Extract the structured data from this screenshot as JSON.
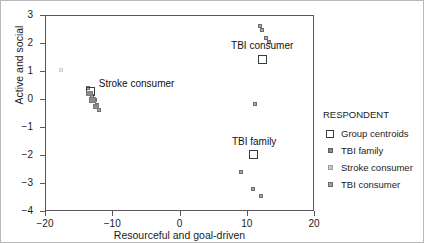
{
  "chart_data": {
    "type": "scatter",
    "title": "",
    "xlabel": "Resourceful and goal-driven",
    "ylabel": "Active and social",
    "xlim": [
      -20,
      20
    ],
    "ylim": [
      -4,
      3
    ],
    "xticks": [
      "-20",
      "-10",
      "0",
      "10",
      "20"
    ],
    "xtick_values": [
      -20,
      -10,
      0,
      10,
      20
    ],
    "yticks": [
      "3",
      "2",
      "1",
      "0",
      "-1",
      "-2",
      "-3",
      "-4"
    ],
    "ytick_values": [
      3,
      2,
      1,
      0,
      -1,
      -2,
      -3,
      -4
    ],
    "grid": false,
    "legend_position": "right",
    "series": [
      {
        "name": "TBI consumer",
        "marker": "small-square",
        "points": [
          {
            "x": 11.9,
            "y": 2.62
          },
          {
            "x": 12.3,
            "y": 2.48
          },
          {
            "x": 12.9,
            "y": 2.18
          },
          {
            "x": 13.3,
            "y": 2.05
          },
          {
            "x": 11.2,
            "y": -0.18
          }
        ]
      },
      {
        "name": "TBI family",
        "marker": "small-square",
        "points": [
          {
            "x": 9.1,
            "y": -2.62
          },
          {
            "x": 11.0,
            "y": -3.22
          },
          {
            "x": 12.1,
            "y": -3.48
          }
        ]
      },
      {
        "name": "Stroke consumer",
        "marker": "small-square",
        "points": [
          {
            "x": -17.6,
            "y": 1.02
          },
          {
            "x": -13.6,
            "y": 0.38
          },
          {
            "x": -13.0,
            "y": 0.12
          },
          {
            "x": -12.6,
            "y": -0.05
          },
          {
            "x": -12.2,
            "y": -0.22
          },
          {
            "x": -11.9,
            "y": -0.38
          }
        ]
      },
      {
        "name": "Group centroids",
        "marker": "open-square",
        "points": [
          {
            "x": 12.3,
            "y": 1.42,
            "label": "TBI consumer"
          },
          {
            "x": 11.0,
            "y": -1.98,
            "label": "TBI family"
          },
          {
            "x": -13.3,
            "y": 0.28,
            "label": "Stroke consumer"
          }
        ]
      }
    ],
    "annotations": [
      {
        "text": "TBI consumer",
        "x": 12.3,
        "y": 1.9
      },
      {
        "text": "Stroke consumer",
        "x": -12.3,
        "y": 0.55
      },
      {
        "text": "TBI family",
        "x": 11.1,
        "y": -1.55
      }
    ]
  },
  "legend": {
    "title": "RESPONDENT",
    "entries": [
      {
        "label": "Group centroids",
        "swatch": "centroid-square-icon"
      },
      {
        "label": "TBI family",
        "swatch": "tbi-family-square-icon"
      },
      {
        "label": "Stroke consumer",
        "swatch": "stroke-consumer-square-icon"
      },
      {
        "label": "TBI consumer",
        "swatch": "tbi-consumer-square-icon"
      }
    ]
  }
}
